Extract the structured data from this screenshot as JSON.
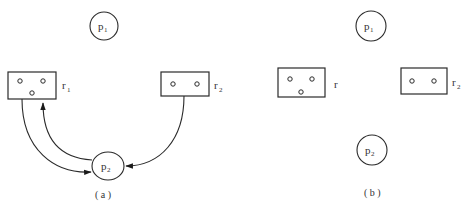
{
  "panels": [
    {
      "id": "a",
      "caption": "( a )",
      "processes": [
        {
          "label": "p",
          "subscript": "1"
        },
        {
          "label": "p",
          "subscript": "2"
        }
      ],
      "resources": [
        {
          "label": "r",
          "subscript": "1",
          "instances": 3
        },
        {
          "label": "r",
          "subscript": "2",
          "instances": 2
        }
      ],
      "edges": [
        {
          "from": "r1",
          "to": "p2",
          "type": "assignment"
        },
        {
          "from": "p2",
          "to": "r1",
          "type": "request"
        },
        {
          "from": "r2",
          "to": "p2",
          "type": "assignment"
        }
      ]
    },
    {
      "id": "b",
      "caption": "( b )",
      "processes": [
        {
          "label": "p",
          "subscript": "1"
        },
        {
          "label": "p",
          "subscript": "2"
        }
      ],
      "resources": [
        {
          "label": "r",
          "subscript": "",
          "instances": 3
        },
        {
          "label": "r",
          "subscript": "2",
          "instances": 2
        }
      ],
      "edges": []
    }
  ]
}
